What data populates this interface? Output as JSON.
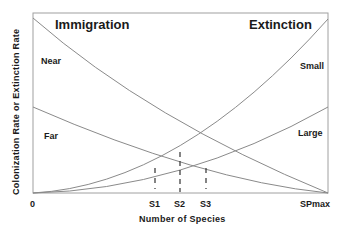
{
  "diagram": {
    "titles": {
      "left": "Immigration",
      "right": "Extinction"
    },
    "axes": {
      "xlabel": "Number of Species",
      "ylabel": "Colonization Rate or Extinction Rate",
      "x_ticks": [
        "0",
        "S1",
        "S2",
        "S3",
        "SPmax"
      ]
    },
    "curves": {
      "immigration": [
        {
          "label": "Near",
          "type": "decreasing"
        },
        {
          "label": "Far",
          "type": "decreasing"
        }
      ],
      "extinction": [
        {
          "label": "Small",
          "type": "increasing"
        },
        {
          "label": "Large",
          "type": "increasing"
        }
      ]
    },
    "equilibria": [
      {
        "label": "S1",
        "meaning": "Far immigration x Small extinction"
      },
      {
        "label": "S2",
        "meaning": "Near x Small and Far x Large"
      },
      {
        "label": "S3",
        "meaning": "Near immigration x Large extinction"
      }
    ],
    "colors": {
      "line": "#8a8a8a",
      "frame": "#9a9a9a",
      "text": "#1a1a1a"
    }
  }
}
